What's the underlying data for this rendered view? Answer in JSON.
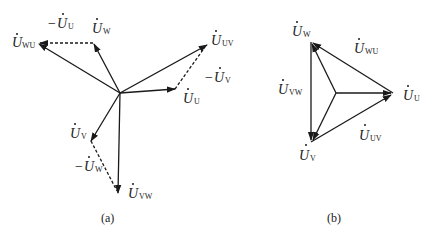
{
  "figure": {
    "panel_a": {
      "caption": "(a)",
      "labels": {
        "u_wu": {
          "main": "U",
          "sub": "WU"
        },
        "neg_u_u": {
          "prefix": "−",
          "main": "U",
          "sub": "U"
        },
        "u_w": {
          "main": "U",
          "sub": "W"
        },
        "u_uv": {
          "main": "U",
          "sub": "UV"
        },
        "neg_u_v": {
          "prefix": "−",
          "main": "U",
          "sub": "V"
        },
        "u_u": {
          "main": "U",
          "sub": "U"
        },
        "u_v": {
          "main": "U",
          "sub": "V"
        },
        "neg_u_w": {
          "prefix": "−",
          "main": "U",
          "sub": "W"
        },
        "u_vw": {
          "main": "U",
          "sub": "VW"
        }
      }
    },
    "panel_b": {
      "caption": "(b)",
      "labels": {
        "u_w": {
          "main": "U",
          "sub": "W"
        },
        "u_wu": {
          "main": "U",
          "sub": "WU"
        },
        "u_vw": {
          "main": "U",
          "sub": "VW"
        },
        "u_u": {
          "main": "U",
          "sub": "U"
        },
        "u_v": {
          "main": "U",
          "sub": "V"
        },
        "u_uv": {
          "main": "U",
          "sub": "UV"
        }
      }
    },
    "colors": {
      "ink": "#1a1a1a",
      "background": "#ffffff"
    }
  }
}
